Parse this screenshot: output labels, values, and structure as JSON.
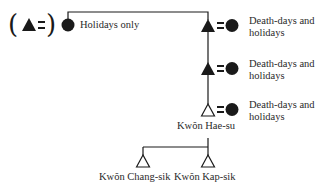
{
  "legend": {
    "open_paren": "(",
    "close_paren": ")",
    "meaning": "filled triangle equals"
  },
  "root": {
    "label": "Holidays only"
  },
  "generations": [
    {
      "node_type": "filled-triangle",
      "ritual_label": "Death-days and holidays"
    },
    {
      "node_type": "filled-triangle",
      "ritual_label": "Death-days and holidays"
    },
    {
      "node_type": "open-triangle",
      "ritual_label": "Death-days and holidays",
      "name": "Kwŏn Hae-su"
    }
  ],
  "children": [
    {
      "name": "Kwŏn Chang-sik"
    },
    {
      "name": "Kwŏn Kap-sik"
    }
  ],
  "colors": {
    "ink": "#1a1a1a",
    "background": "#ffffff"
  }
}
